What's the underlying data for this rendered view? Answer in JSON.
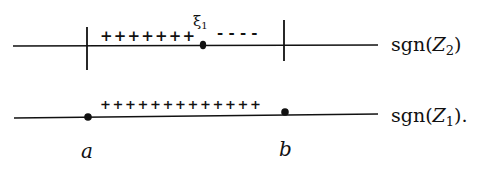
{
  "diagram": {
    "top_line": {
      "label_prefix": "sgn(",
      "label_var": "Z",
      "label_sub": "2",
      "label_suffix": ")",
      "plus_signs": "+++++++",
      "minus_signs": "- - - -",
      "point_label": "ξ",
      "point_sub": "1"
    },
    "bottom_line": {
      "label_prefix": "sgn(",
      "label_var": "Z",
      "label_sub": "1",
      "label_suffix": ").",
      "plus_signs": "+++++++++++++"
    },
    "endpoints": {
      "left": "a",
      "right": "b"
    },
    "colors": {
      "ink": "#111111",
      "background": "#ffffff"
    }
  }
}
